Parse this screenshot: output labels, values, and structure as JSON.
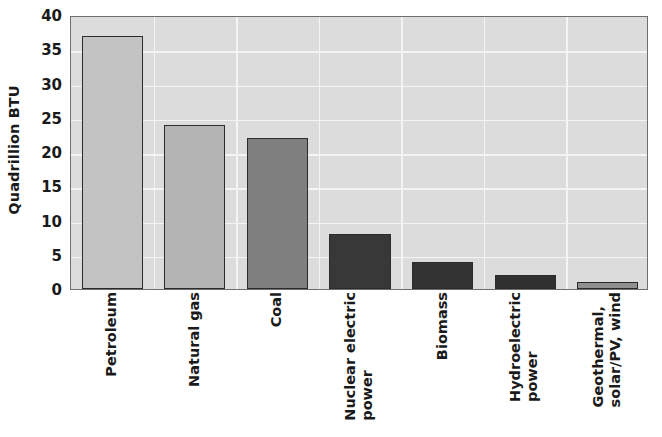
{
  "chart_data": {
    "type": "bar",
    "title": "",
    "xlabel": "",
    "ylabel": "Quadrillion BTU",
    "ylim": [
      0,
      40
    ],
    "ytick_step": 5,
    "yticks": [
      "40",
      "35",
      "30",
      "25",
      "20",
      "15",
      "10",
      "5",
      "0"
    ],
    "grid": "horizontal-and-vertical white gridlines on light gray panel",
    "legend": "none",
    "categories": [
      "Petroleum",
      "Natural gas",
      "Coal",
      "Nuclear electric power",
      "Biomass",
      "Hydroelectric power",
      "Geothermal, solar/PV, wind"
    ],
    "category_lines": [
      [
        "Petroleum"
      ],
      [
        "Natural gas"
      ],
      [
        "Coal"
      ],
      [
        "Nuclear electric",
        "power"
      ],
      [
        "Biomass"
      ],
      [
        "Hydroelectric",
        "power"
      ],
      [
        "Geothermal,",
        "solar/PV, wind"
      ]
    ],
    "values": [
      37,
      24,
      22,
      8,
      4,
      2,
      1
    ],
    "bar_colors": [
      "#c3c3c3",
      "#b4b4b4",
      "#7f7f7f",
      "#383838",
      "#333333",
      "#303030",
      "#909090"
    ]
  },
  "style": {
    "panel_background": "#dcdcdc",
    "gridline_color": "#f4f4f4",
    "axis_border": "#6e6e6e",
    "bar_edge": "#2b2b2b",
    "text_color": "#1a1a1a",
    "page_background": "#ffffff"
  }
}
